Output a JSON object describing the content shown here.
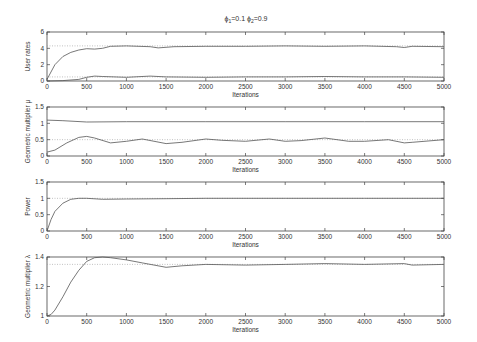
{
  "title_parts": {
    "phi1": "ϕ",
    "sub1": "1",
    "val1": "=0.1 ",
    "phi2": "ϕ",
    "sub2": "2",
    "val2": "=0.9"
  },
  "chart_data": [
    {
      "type": "line",
      "title": "ϕ₁=0.1 ϕ₂=0.9",
      "xlabel": "Iterations",
      "ylabel": "User rates",
      "xlim": [
        0,
        5000
      ],
      "ylim": [
        0,
        6
      ],
      "xticks": [
        0,
        500,
        1000,
        1500,
        2000,
        2500,
        3000,
        3500,
        4000,
        4500,
        5000
      ],
      "yticks": [
        0,
        2,
        4,
        6
      ],
      "reference_lines": [
        4.3,
        0.5
      ],
      "series": [
        {
          "name": "user 1",
          "x": [
            0,
            100,
            200,
            300,
            400,
            500,
            600,
            700,
            800,
            1000,
            1300,
            1400,
            1600,
            2000,
            2500,
            3000,
            3500,
            4000,
            4400,
            4500,
            4600,
            5000
          ],
          "values": [
            0.2,
            2.0,
            3.0,
            3.5,
            3.8,
            3.95,
            3.9,
            4.0,
            4.25,
            4.3,
            4.2,
            4.05,
            4.2,
            4.25,
            4.25,
            4.3,
            4.25,
            4.3,
            4.2,
            4.1,
            4.25,
            4.2
          ]
        },
        {
          "name": "user 2",
          "x": [
            0,
            200,
            400,
            500,
            600,
            700,
            1000,
            1300,
            1500,
            2000,
            2500,
            3000,
            3500,
            4000,
            4500,
            5000
          ],
          "values": [
            0.0,
            0.05,
            0.2,
            0.45,
            0.6,
            0.55,
            0.45,
            0.6,
            0.5,
            0.45,
            0.5,
            0.5,
            0.55,
            0.5,
            0.5,
            0.45
          ]
        }
      ],
      "grid": false
    },
    {
      "type": "line",
      "xlabel": "Iterations",
      "ylabel": "Geometric multiplier μ",
      "xlim": [
        0,
        5000
      ],
      "ylim": [
        0,
        1.5
      ],
      "xticks": [
        0,
        500,
        1000,
        1500,
        2000,
        2500,
        3000,
        3500,
        4000,
        4500,
        5000
      ],
      "yticks": [
        0,
        0.5,
        1,
        1.5
      ],
      "reference_lines": [
        0.5
      ],
      "series": [
        {
          "name": "mu upper",
          "x": [
            0,
            200,
            500,
            1000,
            2000,
            3000,
            4000,
            5000
          ],
          "values": [
            1.1,
            1.08,
            1.04,
            1.05,
            1.05,
            1.05,
            1.05,
            1.05
          ]
        },
        {
          "name": "mu lower",
          "x": [
            0,
            100,
            250,
            400,
            500,
            600,
            800,
            1000,
            1200,
            1500,
            1700,
            2000,
            2200,
            2500,
            2800,
            3000,
            3200,
            3500,
            3800,
            4000,
            4300,
            4500,
            4600,
            5000
          ],
          "values": [
            0.12,
            0.18,
            0.4,
            0.57,
            0.6,
            0.55,
            0.4,
            0.45,
            0.52,
            0.38,
            0.42,
            0.52,
            0.48,
            0.45,
            0.52,
            0.45,
            0.47,
            0.55,
            0.45,
            0.45,
            0.5,
            0.4,
            0.42,
            0.5
          ]
        }
      ],
      "grid": false
    },
    {
      "type": "line",
      "xlabel": "Iterations",
      "ylabel": "Power",
      "xlim": [
        0,
        5000
      ],
      "ylim": [
        0,
        1.5
      ],
      "xticks": [
        0,
        500,
        1000,
        1500,
        2000,
        2500,
        3000,
        3500,
        4000,
        4500,
        5000
      ],
      "yticks": [
        0,
        0.5,
        1,
        1.5
      ],
      "reference_lines": [
        1
      ],
      "series": [
        {
          "name": "power",
          "x": [
            0,
            50,
            100,
            200,
            300,
            400,
            500,
            700,
            1000,
            1500,
            2000,
            3000,
            4000,
            5000
          ],
          "values": [
            0.0,
            0.35,
            0.6,
            0.85,
            0.97,
            1.0,
            1.0,
            0.97,
            0.98,
            0.99,
            1.0,
            1.0,
            1.0,
            1.0
          ]
        }
      ],
      "grid": false
    },
    {
      "type": "line",
      "xlabel": "Iterations",
      "ylabel": "Geometric multiplier λ",
      "xlim": [
        0,
        5000
      ],
      "ylim": [
        1,
        1.4
      ],
      "xticks": [
        0,
        500,
        1000,
        1500,
        2000,
        2500,
        3000,
        3500,
        4000,
        4500,
        5000
      ],
      "yticks": [
        1,
        1.2,
        1.4
      ],
      "reference_lines": [
        1.35
      ],
      "series": [
        {
          "name": "lambda",
          "x": [
            0,
            50,
            100,
            200,
            300,
            400,
            500,
            600,
            700,
            800,
            1000,
            1200,
            1500,
            1700,
            2000,
            2500,
            3000,
            3500,
            4000,
            4500,
            4600,
            5000
          ],
          "values": [
            1.0,
            1.01,
            1.04,
            1.13,
            1.23,
            1.31,
            1.37,
            1.395,
            1.4,
            1.395,
            1.38,
            1.36,
            1.33,
            1.34,
            1.35,
            1.345,
            1.35,
            1.355,
            1.35,
            1.355,
            1.345,
            1.35
          ]
        }
      ],
      "grid": false
    }
  ]
}
